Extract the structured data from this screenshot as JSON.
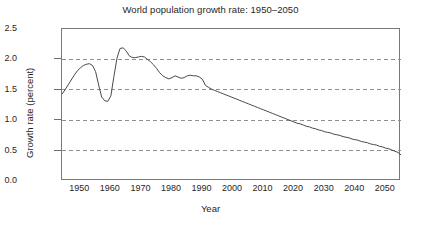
{
  "chart_data": {
    "type": "line",
    "title": "World population growth rate: 1950–2050",
    "xlabel": "Year",
    "ylabel": "Growth rate (percent)",
    "xlim": [
      1944,
      2055
    ],
    "ylim": [
      0.0,
      2.5
    ],
    "xticks": [
      1950,
      1960,
      1970,
      1980,
      1990,
      2000,
      2010,
      2020,
      2030,
      2040,
      2050
    ],
    "xtick_labels": [
      "1950",
      "1960",
      "1970",
      "1980",
      "1990",
      "2000",
      "2010",
      "2020",
      "2030",
      "2040",
      "2050"
    ],
    "yticks": [
      0.0,
      0.5,
      1.0,
      1.5,
      2.0,
      2.5
    ],
    "ytick_labels": [
      "0.0",
      "0.5",
      "1.0",
      "1.5",
      "2.0",
      "2.5"
    ],
    "grid": "horizontal-dashed",
    "gridlines_at": [
      0.5,
      1.0,
      1.5,
      2.0
    ],
    "legend": "none",
    "line_color": "#4a4a4a",
    "frame_color": "#7a7a7a",
    "grid_color": "#8f8f8f",
    "series": [
      {
        "name": "World population growth rate",
        "x": [
          1944,
          1945,
          1946,
          1947,
          1948,
          1949,
          1950,
          1951,
          1952,
          1953,
          1954,
          1955,
          1956,
          1957,
          1958,
          1959,
          1960,
          1961,
          1962,
          1963,
          1964,
          1965,
          1966,
          1967,
          1968,
          1969,
          1970,
          1971,
          1972,
          1973,
          1974,
          1975,
          1976,
          1977,
          1978,
          1979,
          1980,
          1981,
          1982,
          1983,
          1984,
          1985,
          1986,
          1987,
          1988,
          1989,
          1990,
          1991,
          1992,
          1993,
          1994,
          1995,
          1996,
          1997,
          1998,
          1999,
          2000,
          2001,
          2002,
          2003,
          2004,
          2005,
          2006,
          2007,
          2008,
          2009,
          2010,
          2011,
          2012,
          2013,
          2014,
          2015,
          2016,
          2017,
          2018,
          2019,
          2020,
          2021,
          2022,
          2023,
          2024,
          2025,
          2026,
          2027,
          2028,
          2029,
          2030,
          2031,
          2032,
          2033,
          2034,
          2035,
          2036,
          2037,
          2038,
          2039,
          2040,
          2041,
          2042,
          2043,
          2044,
          2045,
          2046,
          2047,
          2048,
          2049,
          2050,
          2051,
          2052,
          2053,
          2054,
          2055
        ],
        "y": [
          1.43,
          1.5,
          1.58,
          1.66,
          1.74,
          1.81,
          1.86,
          1.9,
          1.92,
          1.93,
          1.9,
          1.8,
          1.58,
          1.38,
          1.32,
          1.31,
          1.4,
          1.72,
          2.02,
          2.18,
          2.19,
          2.14,
          2.06,
          2.03,
          2.03,
          2.04,
          2.05,
          2.04,
          2.0,
          1.96,
          1.91,
          1.85,
          1.78,
          1.73,
          1.7,
          1.68,
          1.7,
          1.73,
          1.71,
          1.69,
          1.7,
          1.73,
          1.74,
          1.73,
          1.73,
          1.71,
          1.67,
          1.57,
          1.54,
          1.51,
          1.49,
          1.47,
          1.45,
          1.43,
          1.41,
          1.39,
          1.37,
          1.35,
          1.33,
          1.31,
          1.29,
          1.27,
          1.25,
          1.23,
          1.21,
          1.19,
          1.17,
          1.15,
          1.13,
          1.11,
          1.09,
          1.07,
          1.05,
          1.03,
          1.01,
          0.99,
          0.97,
          0.95,
          0.94,
          0.92,
          0.9,
          0.89,
          0.87,
          0.86,
          0.84,
          0.83,
          0.81,
          0.8,
          0.79,
          0.77,
          0.76,
          0.75,
          0.73,
          0.72,
          0.71,
          0.69,
          0.68,
          0.67,
          0.65,
          0.64,
          0.63,
          0.61,
          0.6,
          0.59,
          0.57,
          0.56,
          0.54,
          0.53,
          0.51,
          0.49,
          0.47,
          0.43
        ]
      }
    ]
  }
}
